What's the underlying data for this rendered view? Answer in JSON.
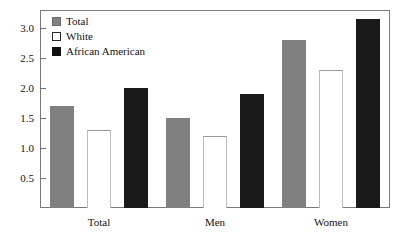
{
  "chart_data": {
    "type": "bar",
    "title": "",
    "subtitle": "",
    "xlabel": "",
    "ylabel": "",
    "categories": [
      "Total",
      "Men",
      "Women"
    ],
    "series": [
      {
        "name": "Total",
        "color": "#808080",
        "values": [
          1.7,
          1.5,
          2.8
        ]
      },
      {
        "name": "White",
        "color": "#ffffff",
        "values": [
          1.3,
          1.2,
          2.3
        ]
      },
      {
        "name": "African American",
        "color": "#111111",
        "values": [
          2.0,
          1.9,
          3.15
        ]
      }
    ],
    "ylim": [
      0,
      3.3
    ],
    "yticks": [
      0.5,
      1.0,
      1.5,
      2.0,
      2.5,
      3.0
    ],
    "ytick_labels": [
      "0.5",
      "1.0",
      "1.5",
      "2.0",
      "2.5",
      "3.0"
    ],
    "grid": false,
    "legend_position": "top-left",
    "frame": true
  },
  "legend": {
    "items": [
      {
        "label": "Total"
      },
      {
        "label": "White"
      },
      {
        "label": "African American"
      }
    ]
  },
  "axis": {
    "y_tick_labels": [
      "3.0",
      "2.5",
      "2.0",
      "1.5",
      "1.0",
      "0.5"
    ],
    "x_tick_labels": [
      "Total",
      "Men",
      "Women"
    ]
  },
  "colors": {
    "total": "#808080",
    "white": "#ffffff",
    "african_american": "#111111",
    "frame": "#7a7a7a",
    "text": "#141414",
    "background": "#ffffff"
  }
}
